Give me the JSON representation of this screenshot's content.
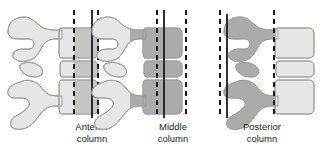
{
  "figure": {
    "background_color": "#ffffff",
    "width": 321,
    "height": 148,
    "orientation_note": "Anterior to the right, posterior to the left",
    "colors": {
      "bone_light": "#e6e6e4",
      "bone_outline": "#9a9a98",
      "highlight_anterior": "#c3c3c0",
      "highlight_middle": "#a8a8a5",
      "highlight_posterior": "#a8a8a5",
      "line_color": "#1a1a1a",
      "text_color": "#231f20"
    }
  },
  "panels": [
    {
      "id": "anterior",
      "label_line1": "Anterior",
      "label_line2": "column",
      "label_x": 92,
      "shaded_region": "anterior two-thirds of the vertebral bodies and disc",
      "markers": [
        {
          "name": "posterior-boundary-line",
          "style": "dashed",
          "x": 74
        },
        {
          "name": "anterior-body-margin-line",
          "style": "solid",
          "x": 92
        },
        {
          "name": "anterior-outer-line",
          "style": "dashed",
          "x": 98
        }
      ]
    },
    {
      "id": "middle",
      "label_line1": "Middle",
      "label_line2": "column",
      "label_x": 173,
      "shaded_region": "posterior third of the vertebral bodies and disc",
      "markers": [
        {
          "name": "posterior-body-line",
          "style": "dashed",
          "x": 157
        },
        {
          "name": "middle-column-anterior-line",
          "style": "solid",
          "x": 164
        },
        {
          "name": "middle-column-posterior-line",
          "style": "dashed",
          "x": 186
        }
      ]
    },
    {
      "id": "posterior",
      "label_line1": "Posterior",
      "label_line2": "column",
      "label_x": 262,
      "shaded_region": "posterior elements: pedicles, facets, laminae and spinous processes",
      "markers": [
        {
          "name": "posterior-outer-line",
          "style": "dashed",
          "x": 220
        },
        {
          "name": "spinous-process-line",
          "style": "solid",
          "x": 227
        },
        {
          "name": "posterior-body-margin-line",
          "style": "dashed",
          "x": 274
        }
      ]
    }
  ],
  "anatomy": {
    "structures": [
      "upper vertebra",
      "lower vertebra",
      "intervertebral disc",
      "spinous process",
      "superior articular process",
      "inferior articular process",
      "vertebral body"
    ]
  }
}
